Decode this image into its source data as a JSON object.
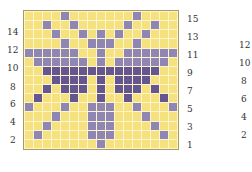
{
  "colors": {
    "background": "#f5e27e",
    "light_purple": "#8f86b4",
    "dark_purple": "#65568f",
    "gridline": "#fbf4cf",
    "border": "#a89a60"
  },
  "grid": {
    "columns": 17,
    "rows": 15,
    "legend": {
      "0": "yellow",
      "1": "light purple",
      "2": "dark purple"
    },
    "cells": [
      [
        0,
        0,
        0,
        0,
        1,
        0,
        0,
        0,
        0,
        0,
        0,
        0,
        1,
        0,
        0,
        0,
        0
      ],
      [
        0,
        0,
        1,
        0,
        0,
        1,
        0,
        0,
        0,
        0,
        0,
        1,
        0,
        0,
        1,
        0,
        0
      ],
      [
        0,
        0,
        0,
        1,
        0,
        0,
        1,
        0,
        1,
        0,
        1,
        0,
        0,
        1,
        0,
        0,
        0
      ],
      [
        0,
        0,
        0,
        0,
        1,
        0,
        0,
        1,
        1,
        1,
        0,
        0,
        1,
        0,
        0,
        0,
        0
      ],
      [
        1,
        1,
        1,
        1,
        1,
        1,
        0,
        0,
        1,
        0,
        0,
        1,
        1,
        1,
        1,
        1,
        1
      ],
      [
        0,
        1,
        1,
        1,
        1,
        1,
        1,
        0,
        1,
        0,
        1,
        1,
        1,
        1,
        1,
        1,
        0
      ],
      [
        0,
        0,
        2,
        2,
        2,
        2,
        2,
        2,
        2,
        2,
        2,
        2,
        2,
        2,
        2,
        0,
        0
      ],
      [
        0,
        0,
        0,
        2,
        2,
        2,
        2,
        0,
        2,
        0,
        2,
        2,
        2,
        2,
        0,
        0,
        0
      ],
      [
        0,
        0,
        2,
        0,
        2,
        2,
        2,
        0,
        2,
        0,
        2,
        2,
        2,
        0,
        2,
        0,
        0
      ],
      [
        0,
        2,
        0,
        0,
        0,
        2,
        0,
        0,
        2,
        0,
        0,
        2,
        0,
        0,
        0,
        2,
        0
      ],
      [
        1,
        0,
        0,
        0,
        1,
        0,
        0,
        1,
        1,
        1,
        0,
        0,
        1,
        0,
        0,
        0,
        1
      ],
      [
        0,
        0,
        0,
        1,
        0,
        0,
        0,
        1,
        1,
        1,
        0,
        0,
        0,
        1,
        0,
        0,
        0
      ],
      [
        0,
        0,
        1,
        0,
        0,
        0,
        0,
        1,
        1,
        1,
        0,
        0,
        0,
        0,
        1,
        0,
        0
      ],
      [
        0,
        1,
        0,
        0,
        0,
        0,
        0,
        1,
        1,
        1,
        0,
        0,
        0,
        0,
        0,
        1,
        0
      ],
      [
        0,
        0,
        0,
        0,
        0,
        0,
        0,
        0,
        1,
        0,
        0,
        0,
        0,
        0,
        0,
        0,
        0
      ]
    ]
  },
  "labels": {
    "left": [
      "14",
      "12",
      "10",
      "8",
      "6",
      "4",
      "2"
    ],
    "right": [
      "15",
      "13",
      "11",
      "9",
      "7",
      "5",
      "3",
      "1"
    ],
    "far_right": [
      "12",
      "10",
      "8",
      "6",
      "4",
      "2"
    ]
  }
}
